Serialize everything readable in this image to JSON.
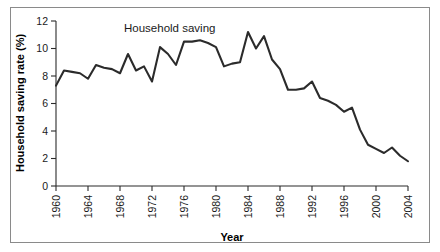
{
  "figure": {
    "border_color": "#8a8a8a",
    "background": "#ffffff",
    "line_color": "#2b2b2b"
  },
  "chart_data": {
    "type": "line",
    "title": "",
    "xlabel": "Year",
    "ylabel": "Household saving rate (%)",
    "annotation": "Household saving",
    "grid": false,
    "legend_position": "none",
    "xlim": [
      1960,
      2004
    ],
    "ylim": [
      0,
      12
    ],
    "ytick_labels": [
      "0",
      "2",
      "4",
      "6",
      "8",
      "10",
      "12"
    ],
    "ytick_values": [
      0,
      2,
      4,
      6,
      8,
      10,
      12
    ],
    "xtick_labels": [
      "1960",
      "1964",
      "1968",
      "1972",
      "1976",
      "1980",
      "1984",
      "1988",
      "1992",
      "1996",
      "2000",
      "2004"
    ],
    "xtick_values": [
      1960,
      1964,
      1968,
      1972,
      1976,
      1980,
      1984,
      1988,
      1992,
      1996,
      2000,
      2004
    ],
    "x": [
      1960,
      1961,
      1962,
      1963,
      1964,
      1965,
      1966,
      1967,
      1968,
      1969,
      1970,
      1971,
      1972,
      1973,
      1974,
      1975,
      1976,
      1977,
      1978,
      1979,
      1980,
      1981,
      1982,
      1983,
      1984,
      1985,
      1986,
      1987,
      1988,
      1989,
      1990,
      1991,
      1992,
      1993,
      1994,
      1995,
      1996,
      1997,
      1998,
      1999,
      2000,
      2001,
      2002,
      2003,
      2004
    ],
    "values": [
      7.3,
      8.4,
      8.3,
      8.2,
      7.8,
      8.8,
      8.6,
      8.5,
      8.2,
      9.6,
      8.4,
      8.7,
      7.6,
      10.1,
      9.6,
      8.8,
      10.5,
      10.5,
      10.6,
      10.4,
      10.1,
      8.7,
      8.9,
      9.0,
      11.2,
      10.0,
      10.9,
      9.2,
      8.5,
      7.0,
      7.0,
      7.1,
      7.6,
      6.4,
      6.2,
      5.9,
      5.4,
      5.7,
      4.1,
      3.0,
      2.7,
      2.4,
      2.8,
      2.2,
      1.8
    ],
    "series_name": "Household saving"
  }
}
